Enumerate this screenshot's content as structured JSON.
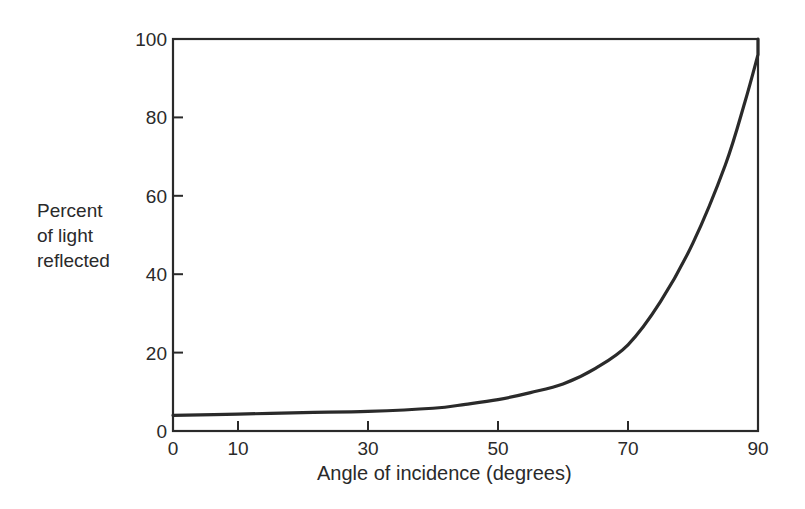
{
  "chart_data": {
    "type": "line",
    "title": "",
    "xlabel": "Angle of incidence (degrees)",
    "ylabel_lines": [
      "Percent",
      "of light",
      "reflected"
    ],
    "ylabel": "Percent of light reflected",
    "xlim": [
      0,
      90
    ],
    "ylim": [
      0,
      100
    ],
    "x_ticks": [
      0,
      10,
      30,
      50,
      70,
      90
    ],
    "y_ticks": [
      0,
      20,
      40,
      60,
      80,
      100
    ],
    "grid": false,
    "legend": null,
    "series": [
      {
        "name": "Reflectance",
        "x": [
          0,
          10,
          20,
          30,
          40,
          45,
          50,
          55,
          60,
          65,
          70,
          75,
          80,
          85,
          88,
          90
        ],
        "values": [
          4,
          4.3,
          4.7,
          5,
          5.8,
          6.8,
          8,
          9.8,
          12,
          16,
          22,
          33,
          48,
          68,
          84,
          96
        ]
      }
    ],
    "line_color": "#2a2a2a"
  },
  "axes": {
    "x_tick_labels": [
      "0",
      "10",
      "30",
      "50",
      "70",
      "90"
    ],
    "y_tick_labels": [
      "0",
      "20",
      "40",
      "60",
      "80",
      "100"
    ]
  }
}
